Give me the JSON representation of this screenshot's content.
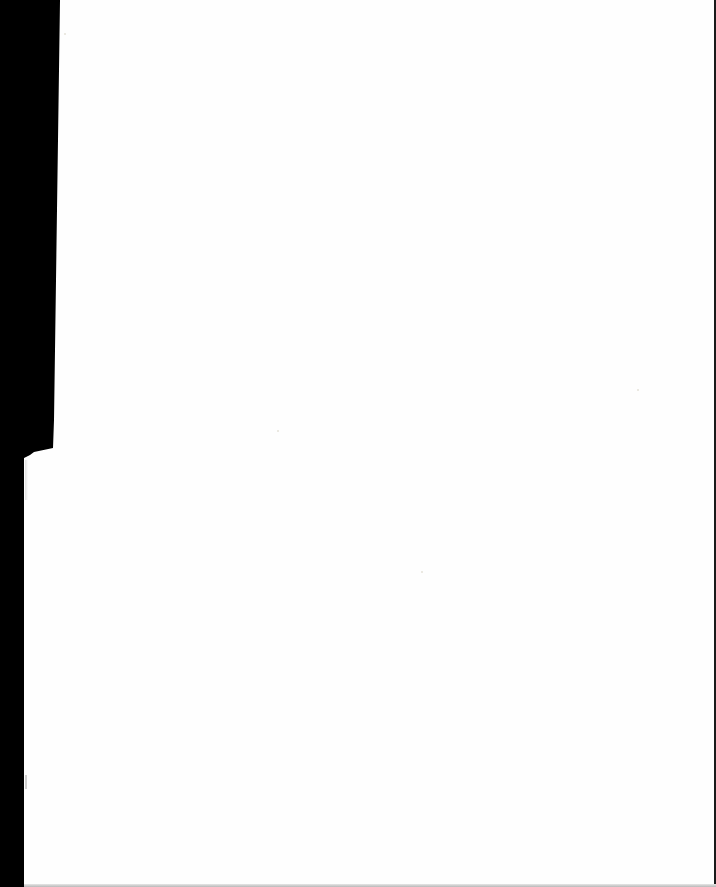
{
  "document": {
    "type": "scanned-page",
    "content_text": "",
    "is_blank": true
  },
  "colors": {
    "page": "#fefefe",
    "scan_border": "#000000",
    "edge_line": "#1a1a1a"
  }
}
